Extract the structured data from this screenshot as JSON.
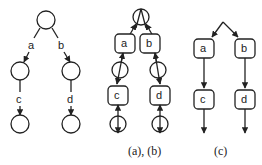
{
  "figure": {
    "panels": [
      {
        "id": "left",
        "edge_labels": [
          "a",
          "b",
          "c",
          "d"
        ]
      },
      {
        "id": "middle",
        "node_labels": [
          "a",
          "b",
          "c",
          "d"
        ],
        "caption": "(a), (b)"
      },
      {
        "id": "right",
        "node_labels": [
          "a",
          "b",
          "c",
          "d"
        ],
        "caption": "(c)"
      }
    ]
  }
}
